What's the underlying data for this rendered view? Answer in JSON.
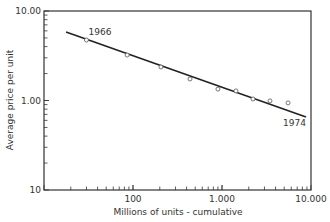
{
  "chart_data": {
    "type": "scatter",
    "title": "",
    "xlabel": "Millions of units - cumulative",
    "ylabel": "Average price per unit",
    "xscale": "log",
    "yscale": "log",
    "xlim": [
      10,
      10000
    ],
    "ylim": [
      0.1,
      10.0
    ],
    "x_tick_labels": [
      "100",
      "1.000",
      "10.000"
    ],
    "x_tick_values": [
      100,
      1000,
      10000
    ],
    "y_tick_labels": [
      "10.00",
      "1.00",
      "10"
    ],
    "y_tick_values": [
      10,
      1,
      0.1
    ],
    "grid": false,
    "legend": null,
    "series": [
      {
        "name": "Observed",
        "marker": "open-circle",
        "x": [
          30,
          86,
          206,
          437,
          900,
          1435,
          2230,
          3460,
          5520
        ],
        "y": [
          4.74,
          3.22,
          2.37,
          1.74,
          1.34,
          1.28,
          1.04,
          0.99,
          0.94
        ]
      },
      {
        "name": "Fitted trend",
        "style": "line",
        "x": [
          17.7,
          8790
        ],
        "y": [
          5.82,
          0.655
        ]
      }
    ],
    "annotations": [
      {
        "text": "1966",
        "x": 30,
        "y": 4.74,
        "position": "above-right"
      },
      {
        "text": "1974",
        "x": 8790,
        "y": 0.655,
        "position": "below-left"
      }
    ],
    "colors": {
      "axis": "#333333",
      "line": "#222222",
      "marker": "#555555"
    }
  }
}
